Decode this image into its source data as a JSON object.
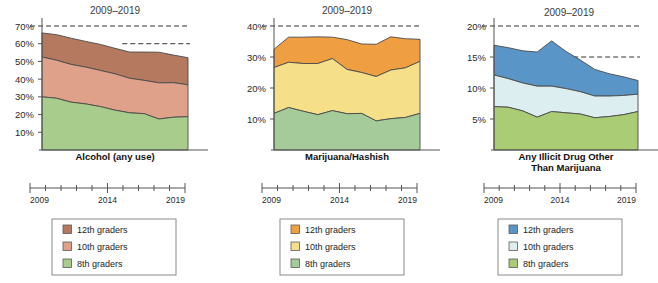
{
  "figure": {
    "background": "#ffffff",
    "range_title": "2009–2019"
  },
  "chart_data": [
    {
      "type": "area",
      "title": "Alcohol (any use)",
      "subtitle": "2009–2019",
      "xlabel": "",
      "ylabel": "",
      "grid": false,
      "legend_position": "bottom",
      "x": [
        2009,
        2010,
        2011,
        2012,
        2013,
        2014,
        2015,
        2016,
        2017,
        2018,
        2019
      ],
      "xtick_labels": [
        "2009",
        "2014",
        "2019"
      ],
      "xtick_label_values": [
        2009,
        2014,
        2019
      ],
      "ylim": [
        0,
        70
      ],
      "ytick_labels": [
        "10%",
        "20%",
        "30%",
        "40%",
        "50%",
        "60%",
        "70%"
      ],
      "ytick_values": [
        10,
        20,
        30,
        40,
        50,
        60,
        70
      ],
      "stacked": true,
      "reference_lines": [
        {
          "value": 70,
          "span": "full",
          "style": "dashed"
        },
        {
          "value": 60,
          "span": "right",
          "style": "dashed"
        }
      ],
      "series": [
        {
          "name": "8th graders",
          "color": "#a7cc8b",
          "values": [
            30.0,
            29.2,
            27.0,
            26.0,
            24.5,
            22.5,
            21.0,
            20.5,
            17.5,
            18.5,
            18.8
          ]
        },
        {
          "name": "10th graders",
          "color": "#e0a18b",
          "values": [
            22.5,
            21.5,
            21.3,
            20.8,
            20.4,
            20.5,
            19.5,
            18.8,
            20.4,
            19.5,
            18.0
          ]
        },
        {
          "name": "12th graders",
          "color": "#b5795f",
          "values": [
            13.6,
            14.4,
            14.8,
            14.5,
            14.7,
            14.4,
            14.8,
            16.0,
            17.3,
            15.6,
            15.3
          ]
        }
      ],
      "totals": [
        66.1,
        65.1,
        63.1,
        61.3,
        59.6,
        57.4,
        55.3,
        55.3,
        55.2,
        53.6,
        52.1
      ]
    },
    {
      "type": "area",
      "title": "Marijuana/Hashish",
      "subtitle": "2009–2019",
      "xlabel": "",
      "ylabel": "",
      "grid": false,
      "legend_position": "bottom",
      "x": [
        2009,
        2010,
        2011,
        2012,
        2013,
        2014,
        2015,
        2016,
        2017,
        2018,
        2019
      ],
      "xtick_labels": [
        "2009",
        "2014",
        "2019"
      ],
      "xtick_label_values": [
        2009,
        2014,
        2019
      ],
      "ylim": [
        0,
        40
      ],
      "ytick_labels": [
        "10%",
        "20%",
        "30%",
        "40%"
      ],
      "ytick_values": [
        10,
        20,
        30,
        40
      ],
      "stacked": true,
      "reference_lines": [
        {
          "value": 40,
          "span": "full",
          "style": "dashed"
        }
      ],
      "series": [
        {
          "name": "8th graders",
          "color": "#a6cb9b",
          "values": [
            11.8,
            13.7,
            12.5,
            11.4,
            12.7,
            11.7,
            11.8,
            9.4,
            10.1,
            10.5,
            11.8
          ]
        },
        {
          "name": "10th graders",
          "color": "#f5e089",
          "values": [
            14.8,
            14.6,
            15.4,
            16.5,
            16.8,
            14.3,
            13.2,
            14.3,
            15.7,
            16.0,
            16.8
          ]
        },
        {
          "name": "12th graders",
          "color": "#ef9f42",
          "values": [
            5.9,
            8.1,
            8.5,
            8.6,
            6.9,
            9.6,
            9.2,
            10.4,
            10.7,
            9.4,
            7.1
          ]
        }
      ],
      "totals": [
        32.5,
        36.4,
        36.4,
        36.5,
        36.4,
        35.6,
        34.2,
        34.1,
        36.5,
        35.9,
        35.7
      ]
    },
    {
      "type": "area",
      "title": "Any Illicit Drug Other Than Marijuana",
      "subtitle": "2009–2019",
      "xlabel": "",
      "ylabel": "",
      "grid": false,
      "legend_position": "bottom",
      "x": [
        2009,
        2010,
        2011,
        2012,
        2013,
        2014,
        2015,
        2016,
        2017,
        2018,
        2019
      ],
      "xtick_labels": [
        "2009",
        "2014",
        "2019"
      ],
      "xtick_label_values": [
        2009,
        2014,
        2019
      ],
      "ylim": [
        0,
        20
      ],
      "ytick_labels": [
        "5%",
        "10%",
        "15%",
        "20%"
      ],
      "ytick_values": [
        5,
        10,
        15,
        20
      ],
      "stacked": true,
      "reference_lines": [
        {
          "value": 20,
          "span": "full",
          "style": "dashed"
        },
        {
          "value": 15,
          "span": "right",
          "style": "dashed"
        }
      ],
      "series": [
        {
          "name": "8th graders",
          "color": "#aacc74",
          "values": [
            7.0,
            6.9,
            6.3,
            5.3,
            6.2,
            6.0,
            5.8,
            5.2,
            5.4,
            5.7,
            6.2
          ]
        },
        {
          "name": "10th graders",
          "color": "#ddeef0",
          "values": [
            5.1,
            4.6,
            4.5,
            5.0,
            4.1,
            3.9,
            3.6,
            3.5,
            3.3,
            3.1,
            2.8
          ]
        },
        {
          "name": "12th graders",
          "color": "#5a95c8",
          "values": [
            4.8,
            5.0,
            5.2,
            5.5,
            7.3,
            6.0,
            5.1,
            4.3,
            3.6,
            3.0,
            2.2
          ]
        }
      ],
      "totals": [
        16.9,
        16.5,
        16.0,
        15.8,
        17.6,
        15.9,
        14.5,
        13.0,
        12.3,
        11.8,
        11.2
      ]
    }
  ],
  "legends": [
    {
      "panel": "Alcohol (any use)",
      "items": [
        {
          "label": "12th graders",
          "color": "#b5795f"
        },
        {
          "label": "10th graders",
          "color": "#e0a18b"
        },
        {
          "label": "8th graders",
          "color": "#a7cc8b"
        }
      ]
    },
    {
      "panel": "Marijuana/Hashish",
      "items": [
        {
          "label": "12th graders",
          "color": "#ef9f42"
        },
        {
          "label": "10th graders",
          "color": "#f5e089"
        },
        {
          "label": "8th graders",
          "color": "#a6cb9b"
        }
      ]
    },
    {
      "panel": "Any Illicit Drug Other Than Marijuana",
      "items": [
        {
          "label": "12th graders",
          "color": "#5a95c8"
        },
        {
          "label": "10th graders",
          "color": "#ddeef0"
        },
        {
          "label": "8th graders",
          "color": "#aacc74"
        }
      ]
    }
  ]
}
